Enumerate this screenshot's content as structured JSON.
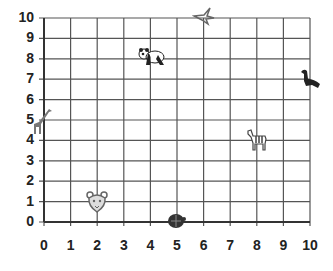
{
  "grid": {
    "x_min": 0,
    "x_max": 10,
    "y_min": 0,
    "y_max": 10,
    "origin_px": [
      44,
      222
    ],
    "unit_px": [
      26.6,
      20.4
    ],
    "line_color": "#555555",
    "axis_color": "#333333"
  },
  "x_ticks": [
    "0",
    "1",
    "2",
    "3",
    "4",
    "5",
    "6",
    "7",
    "8",
    "9",
    "10"
  ],
  "y_ticks": [
    "0",
    "1",
    "2",
    "3",
    "4",
    "5",
    "6",
    "7",
    "8",
    "9",
    "10"
  ],
  "animals": [
    {
      "name": "giraffe",
      "x": 0,
      "y": 5,
      "color": "#777777"
    },
    {
      "name": "tiger",
      "x": 2,
      "y": 1,
      "color": "#666666"
    },
    {
      "name": "turtle",
      "x": 5,
      "y": 0,
      "color": "#333333"
    },
    {
      "name": "panda",
      "x": 4,
      "y": 8,
      "color": "#222222"
    },
    {
      "name": "bird",
      "x": 6,
      "y": 10,
      "color": "#666666"
    },
    {
      "name": "sea-lion",
      "x": 10,
      "y": 7,
      "color": "#222222"
    },
    {
      "name": "zebra",
      "x": 8,
      "y": 4,
      "color": "#444444"
    }
  ]
}
